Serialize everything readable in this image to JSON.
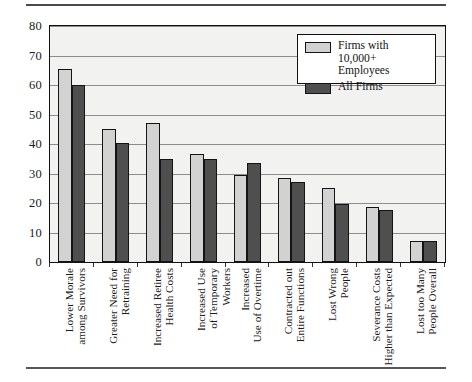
{
  "chart_data": {
    "type": "bar",
    "title": "",
    "xlabel": "",
    "ylabel": "",
    "ylim": [
      0,
      80
    ],
    "ytick_step": 10,
    "yticks": [
      "80",
      "70",
      "60",
      "50",
      "40",
      "30",
      "20",
      "10",
      "0"
    ],
    "grid": true,
    "legend_position": "top-right",
    "categories": [
      "Lower Morale\namong Survivors",
      "Greater Need for\nRetraining",
      "Increased Retiree\nHealth Costs",
      "Increased Use\nof Temporary Workers",
      "Increased\nUse of Overtime",
      "Contracted out\nEntire Functions",
      "Lost Wrong\nPeople",
      "Severance Costs\nHigher than Expected",
      "Lost too Many\nPeople Overall"
    ],
    "series": [
      {
        "name": "Firms with 10,000+ Employees",
        "color": "#d2d2d2",
        "values": [
          65.5,
          45,
          47,
          36.5,
          29.5,
          28.5,
          25,
          18.5,
          7
        ]
      },
      {
        "name": "All Firms",
        "color": "#4f4f4f",
        "values": [
          60,
          40.5,
          35,
          35,
          33.5,
          27,
          19.5,
          17.5,
          7
        ]
      }
    ]
  },
  "legend": {
    "entries": [
      {
        "label": "Firms with 10,000+ Employees"
      },
      {
        "label": "All Firms"
      }
    ]
  }
}
